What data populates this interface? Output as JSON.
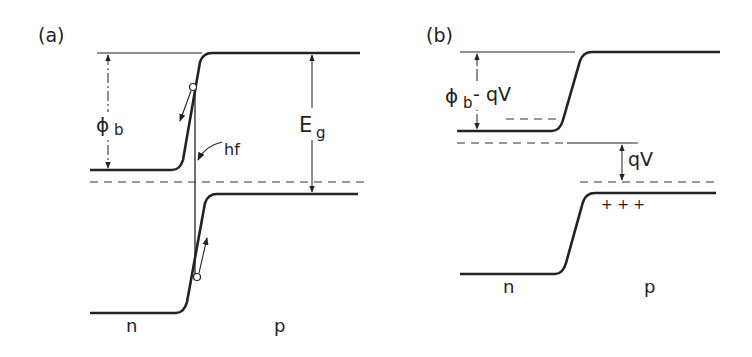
{
  "panel_a": {
    "label": "(a)",
    "phi_b": "ϕ",
    "phi_b_sub": "b",
    "hf": "hf",
    "eg": "E",
    "eg_sub": "g",
    "n": "n",
    "p": "p"
  },
  "panel_b": {
    "label": "(b)",
    "phi_b_minus_qv": "ϕ",
    "phi_b_sub": "b",
    "minus_qv": "- qV",
    "qv": "qV",
    "plus_charges": "+ + +",
    "n": "n",
    "p": "p"
  },
  "colors": {
    "line": "#222222",
    "background": "#ffffff"
  }
}
